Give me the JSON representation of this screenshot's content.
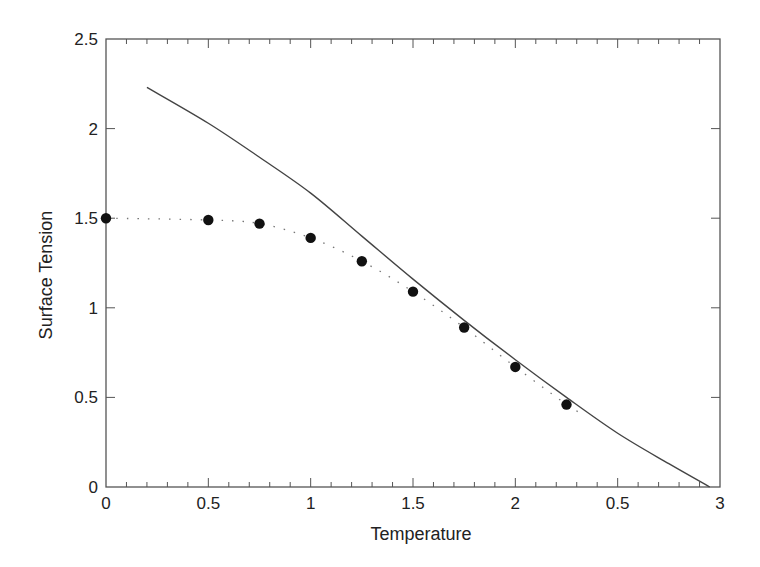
{
  "chart_data": {
    "type": "line",
    "title": "",
    "xlabel": "Temperature",
    "ylabel": "Surface Tension",
    "xlim": [
      0,
      3
    ],
    "ylim": [
      0,
      2.5
    ],
    "grid": false,
    "legend": null,
    "x_ticks": [
      0,
      0.5,
      1,
      1.5,
      2,
      2.5,
      3
    ],
    "x_tick_labels": [
      "0",
      "0.5",
      "1",
      "1.5",
      "2",
      "0.5",
      "3"
    ],
    "x_minor_tick_step": 0.1,
    "y_ticks": [
      0,
      0.5,
      1,
      1.5,
      2,
      2.5
    ],
    "y_tick_labels": [
      "0",
      "0.5",
      "1",
      "1.5",
      "2",
      "2.5"
    ],
    "series": [
      {
        "name": "theory (solid line)",
        "style": "solid",
        "x": [
          0.2,
          0.5,
          0.75,
          1.0,
          1.25,
          1.5,
          1.75,
          2.0,
          2.25,
          2.5,
          2.75,
          2.95
        ],
        "y": [
          2.23,
          2.03,
          1.84,
          1.64,
          1.4,
          1.16,
          0.93,
          0.71,
          0.5,
          0.3,
          0.13,
          0.0
        ]
      },
      {
        "name": "simulation (points, dotted)",
        "style": "dotted-with-markers",
        "x": [
          0,
          0.5,
          0.75,
          1.0,
          1.25,
          1.5,
          1.75,
          2.0,
          2.25
        ],
        "y": [
          1.5,
          1.49,
          1.47,
          1.39,
          1.26,
          1.09,
          0.89,
          0.67,
          0.46
        ]
      }
    ]
  },
  "colors": {
    "axis": "#555555",
    "line": "#444444",
    "marker": "#111111",
    "text": "#222222"
  }
}
